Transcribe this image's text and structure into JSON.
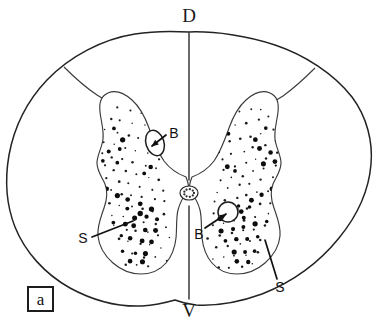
{
  "figure": {
    "panel_label": "a",
    "orientation_labels": {
      "dorsal": "D",
      "ventral": "V"
    },
    "annotations": [
      {
        "id": "b-left",
        "label": "B",
        "meaning": "blood-vessel",
        "x": 174,
        "y": 133
      },
      {
        "id": "b-right",
        "label": "B",
        "meaning": "blood-vessel",
        "x": 199,
        "y": 234
      },
      {
        "id": "s-left",
        "label": "S",
        "meaning": "stained-neuron-cluster",
        "x": 83,
        "y": 238
      },
      {
        "id": "s-right",
        "label": "S",
        "meaning": "stained-neuron-cluster",
        "x": 280,
        "y": 287
      }
    ],
    "colors": {
      "outline": "#232323",
      "gray_matter_stroke": "#3a3a3a",
      "stipple": "#1d1d1d",
      "background": "#ffffff",
      "label_text": "#111111"
    },
    "geometry": {
      "outer_outline": "M 189,32 C 215,31 248,36 275,45 C 305,55 334,74 352,97 C 367,117 373,142 371,164 C 369,190 357,216 339,238 C 318,264 290,283 262,294 C 240,302 215,306 196,305 C 186,304 180,302 175,300 C 168,302 156,305 142,306 C 118,307 92,300 70,288 C 45,274 25,252 15,227 C 6,204 5,178 9,155 C 14,128 27,101 47,80 C 70,56 103,39 135,34 C 153,31 172,31 189,32 Z",
      "dorsal_median": "M 189,33 L 189,180",
      "ventral_median": "M 189,206 L 189,299",
      "gray_left": "M 186,177 C 178,174 170,169 164,161 C 157,151 153,139 149,128 C 145,117 140,107 132,100 C 124,93 115,90 108,93 C 101,96 99,104 100,112 C 101,121 104,130 103,139 C 102,148 97,155 97,163 C 97,171 102,177 105,184 C 108,192 107,200 104,208 C 101,217 97,226 98,236 C 99,247 105,256 113,263 C 121,270 131,274 141,274 C 151,274 160,270 166,263 C 172,256 175,247 176,238 C 177,228 176,218 178,210 C 180,202 184,196 187,192 C 189,189 189,184 186,177 Z",
      "gray_right": "M 192,177 C 200,174 208,169 214,161 C 221,151 225,139 229,128 C 233,117 238,107 246,100 C 254,93 263,90 270,93 C 277,96 279,104 278,112 C 277,121 274,130 275,139 C 276,148 281,155 281,163 C 281,171 276,177 273,184 C 270,192 271,200 274,208 C 277,217 281,226 280,236 C 279,247 273,256 265,263 C 257,270 247,274 237,274 C 227,274 218,270 212,263 C 206,256 203,247 202,238 C 201,228 202,218 200,210 C 198,202 194,196 191,192 C 189,189 189,184 192,177 Z",
      "sulcus_left": "M 64,67 C 73,76 85,87 97,95 C 106,101 114,104 120,104",
      "sulcus_right": "M 315,68 C 306,77 294,88 283,96 C 274,102 266,105 260,105",
      "central_canal": {
        "cx": 189,
        "cy": 193,
        "rx": 9,
        "ry": 7
      },
      "vessel_left": {
        "cx": 155,
        "cy": 143,
        "rx": 9,
        "ry": 13,
        "rotate": -18
      },
      "vessel_right": {
        "cx": 228,
        "cy": 212,
        "r": 10
      },
      "leader_b_left": "M 166,135 L 152,146",
      "leader_b_right": "M 205,228 L 226,214",
      "leader_s_left": "M 92,237 L 133,221",
      "leader_s_right": "M 277,279 L 265,240"
    },
    "stipple_left_small": [
      [
        117,
        108
      ],
      [
        129,
        110
      ],
      [
        140,
        112
      ],
      [
        151,
        116
      ],
      [
        160,
        122
      ],
      [
        166,
        131
      ],
      [
        110,
        118
      ],
      [
        121,
        120
      ],
      [
        133,
        122
      ],
      [
        144,
        126
      ],
      [
        155,
        129
      ],
      [
        164,
        137
      ],
      [
        106,
        130
      ],
      [
        117,
        133
      ],
      [
        128,
        136
      ],
      [
        138,
        139
      ],
      [
        149,
        142
      ],
      [
        160,
        147
      ],
      [
        103,
        142
      ],
      [
        114,
        145
      ],
      [
        125,
        148
      ],
      [
        136,
        151
      ],
      [
        147,
        154
      ],
      [
        158,
        159
      ],
      [
        101,
        154
      ],
      [
        112,
        157
      ],
      [
        123,
        160
      ],
      [
        134,
        163
      ],
      [
        145,
        166
      ],
      [
        156,
        169
      ],
      [
        104,
        166
      ],
      [
        115,
        169
      ],
      [
        126,
        172
      ],
      [
        137,
        175
      ],
      [
        148,
        178
      ],
      [
        159,
        181
      ],
      [
        107,
        178
      ],
      [
        118,
        181
      ],
      [
        129,
        184
      ],
      [
        140,
        186
      ],
      [
        151,
        189
      ],
      [
        162,
        191
      ],
      [
        110,
        190
      ],
      [
        121,
        193
      ],
      [
        132,
        196
      ],
      [
        143,
        198
      ],
      [
        154,
        200
      ],
      [
        165,
        202
      ],
      [
        109,
        202
      ],
      [
        120,
        205
      ],
      [
        131,
        207
      ],
      [
        142,
        210
      ],
      [
        153,
        212
      ],
      [
        164,
        214
      ],
      [
        112,
        214
      ],
      [
        123,
        216
      ],
      [
        134,
        219
      ],
      [
        145,
        221
      ],
      [
        156,
        223
      ],
      [
        167,
        226
      ],
      [
        115,
        226
      ],
      [
        126,
        229
      ],
      [
        137,
        231
      ],
      [
        148,
        233
      ],
      [
        159,
        235
      ],
      [
        170,
        237
      ],
      [
        118,
        240
      ],
      [
        129,
        242
      ],
      [
        140,
        244
      ],
      [
        151,
        246
      ],
      [
        162,
        248
      ],
      [
        122,
        252
      ],
      [
        133,
        254
      ],
      [
        144,
        256
      ],
      [
        155,
        258
      ],
      [
        166,
        260
      ],
      [
        127,
        264
      ],
      [
        138,
        266
      ],
      [
        149,
        267
      ],
      [
        160,
        268
      ]
    ],
    "stipple_left_big": [
      [
        113,
        128
      ],
      [
        124,
        140
      ],
      [
        108,
        152
      ],
      [
        119,
        149
      ],
      [
        104,
        162
      ],
      [
        116,
        163
      ],
      [
        150,
        135
      ],
      [
        161,
        151
      ],
      [
        152,
        166
      ],
      [
        143,
        172
      ],
      [
        106,
        188
      ],
      [
        117,
        195
      ],
      [
        128,
        200
      ],
      [
        139,
        205
      ],
      [
        150,
        208
      ],
      [
        113,
        222
      ],
      [
        124,
        224
      ],
      [
        135,
        226
      ],
      [
        146,
        229
      ],
      [
        157,
        231
      ],
      [
        120,
        236
      ],
      [
        131,
        238
      ],
      [
        142,
        240
      ],
      [
        153,
        242
      ],
      [
        124,
        250
      ],
      [
        135,
        252
      ],
      [
        146,
        253
      ],
      [
        131,
        262
      ],
      [
        142,
        262
      ],
      [
        136,
        218
      ],
      [
        147,
        216
      ],
      [
        158,
        218
      ],
      [
        128,
        208
      ],
      [
        139,
        212
      ]
    ],
    "stipple_right_small": [
      [
        262,
        108
      ],
      [
        250,
        110
      ],
      [
        239,
        112
      ],
      [
        228,
        116
      ],
      [
        219,
        122
      ],
      [
        213,
        131
      ],
      [
        269,
        118
      ],
      [
        258,
        120
      ],
      [
        246,
        122
      ],
      [
        235,
        126
      ],
      [
        224,
        129
      ],
      [
        215,
        137
      ],
      [
        273,
        130
      ],
      [
        262,
        133
      ],
      [
        251,
        136
      ],
      [
        241,
        139
      ],
      [
        230,
        142
      ],
      [
        219,
        147
      ],
      [
        276,
        142
      ],
      [
        265,
        145
      ],
      [
        254,
        148
      ],
      [
        243,
        151
      ],
      [
        232,
        154
      ],
      [
        221,
        159
      ],
      [
        278,
        154
      ],
      [
        267,
        157
      ],
      [
        256,
        160
      ],
      [
        245,
        163
      ],
      [
        234,
        166
      ],
      [
        223,
        169
      ],
      [
        275,
        166
      ],
      [
        264,
        169
      ],
      [
        253,
        172
      ],
      [
        242,
        175
      ],
      [
        231,
        178
      ],
      [
        220,
        181
      ],
      [
        272,
        178
      ],
      [
        261,
        181
      ],
      [
        250,
        184
      ],
      [
        239,
        186
      ],
      [
        228,
        189
      ],
      [
        217,
        191
      ],
      [
        269,
        190
      ],
      [
        258,
        193
      ],
      [
        247,
        196
      ],
      [
        236,
        198
      ],
      [
        225,
        200
      ],
      [
        214,
        202
      ],
      [
        270,
        202
      ],
      [
        259,
        205
      ],
      [
        248,
        207
      ],
      [
        237,
        210
      ],
      [
        226,
        212
      ],
      [
        215,
        214
      ],
      [
        267,
        214
      ],
      [
        256,
        216
      ],
      [
        245,
        219
      ],
      [
        234,
        221
      ],
      [
        223,
        223
      ],
      [
        212,
        226
      ],
      [
        264,
        226
      ],
      [
        253,
        229
      ],
      [
        242,
        231
      ],
      [
        231,
        233
      ],
      [
        220,
        235
      ],
      [
        209,
        237
      ],
      [
        261,
        240
      ],
      [
        250,
        242
      ],
      [
        239,
        244
      ],
      [
        228,
        246
      ],
      [
        217,
        248
      ],
      [
        257,
        252
      ],
      [
        246,
        254
      ],
      [
        235,
        256
      ],
      [
        224,
        258
      ],
      [
        213,
        260
      ],
      [
        252,
        264
      ],
      [
        241,
        266
      ],
      [
        230,
        267
      ],
      [
        219,
        268
      ]
    ],
    "stipple_right_big": [
      [
        266,
        128
      ],
      [
        255,
        140
      ],
      [
        271,
        152
      ],
      [
        260,
        149
      ],
      [
        275,
        162
      ],
      [
        263,
        163
      ],
      [
        229,
        135
      ],
      [
        218,
        151
      ],
      [
        227,
        166
      ],
      [
        236,
        172
      ],
      [
        273,
        188
      ],
      [
        262,
        195
      ],
      [
        251,
        200
      ],
      [
        240,
        205
      ],
      [
        229,
        208
      ],
      [
        266,
        222
      ],
      [
        255,
        224
      ],
      [
        244,
        226
      ],
      [
        233,
        229
      ],
      [
        222,
        231
      ],
      [
        259,
        236
      ],
      [
        248,
        238
      ],
      [
        237,
        240
      ],
      [
        226,
        242
      ],
      [
        255,
        250
      ],
      [
        244,
        252
      ],
      [
        233,
        253
      ],
      [
        248,
        262
      ],
      [
        237,
        262
      ],
      [
        243,
        218
      ],
      [
        232,
        216
      ],
      [
        221,
        218
      ],
      [
        251,
        208
      ],
      [
        240,
        212
      ]
    ]
  }
}
